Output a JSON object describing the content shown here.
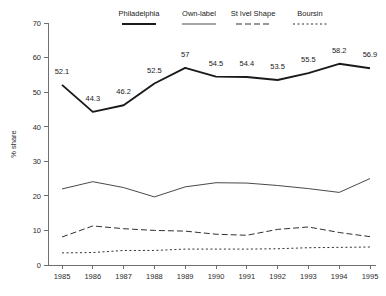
{
  "chart_data": {
    "type": "line",
    "title": "",
    "xlabel": "",
    "ylabel": "% share",
    "ylim": [
      0,
      70
    ],
    "ytick_step": 10,
    "yticks": [
      "0",
      "10",
      "20",
      "30",
      "40",
      "50",
      "60",
      "70"
    ],
    "grid": false,
    "legend_position": "top",
    "categories": [
      "1985",
      "1986",
      "1987",
      "1988",
      "1989",
      "1990",
      "1991",
      "1992",
      "1993",
      "1994",
      "1995"
    ],
    "series": [
      {
        "name": "Philadelphia",
        "style": "solid-thick",
        "color": "#1a1a1a",
        "values": [
          52.1,
          44.3,
          46.2,
          52.5,
          57,
          54.5,
          54.4,
          53.5,
          55.5,
          58.2,
          56.9
        ],
        "labels": [
          "52.1",
          "44.3",
          "46.2",
          "52.5",
          "57",
          "54.5",
          "54.4",
          "53.5",
          "55.5",
          "58.2",
          "56.9"
        ]
      },
      {
        "name": "Own-label",
        "style": "solid-thin",
        "color": "#1a1a1a",
        "values": [
          22.0,
          24.1,
          22.4,
          19.7,
          22.6,
          23.8,
          23.7,
          23.0,
          22.1,
          21.0,
          25.0
        ],
        "labels": []
      },
      {
        "name": "St Ivel Shape",
        "style": "dashed",
        "color": "#1a1a1a",
        "values": [
          8.1,
          11.3,
          10.5,
          10.0,
          9.8,
          8.9,
          8.6,
          10.3,
          11.0,
          9.4,
          8.2
        ],
        "labels": []
      },
      {
        "name": "Boursin",
        "style": "dotted",
        "color": "#1a1a1a",
        "values": [
          3.5,
          3.6,
          4.2,
          4.2,
          4.6,
          4.6,
          4.6,
          4.7,
          5.0,
          5.1,
          5.2
        ],
        "labels": []
      }
    ]
  },
  "legend": {
    "items": [
      {
        "label": "Philadelphia"
      },
      {
        "label": "Own-label"
      },
      {
        "label": "St Ivel Shape"
      },
      {
        "label": "Boursin"
      }
    ]
  },
  "axes": {
    "y_title": "% share"
  }
}
